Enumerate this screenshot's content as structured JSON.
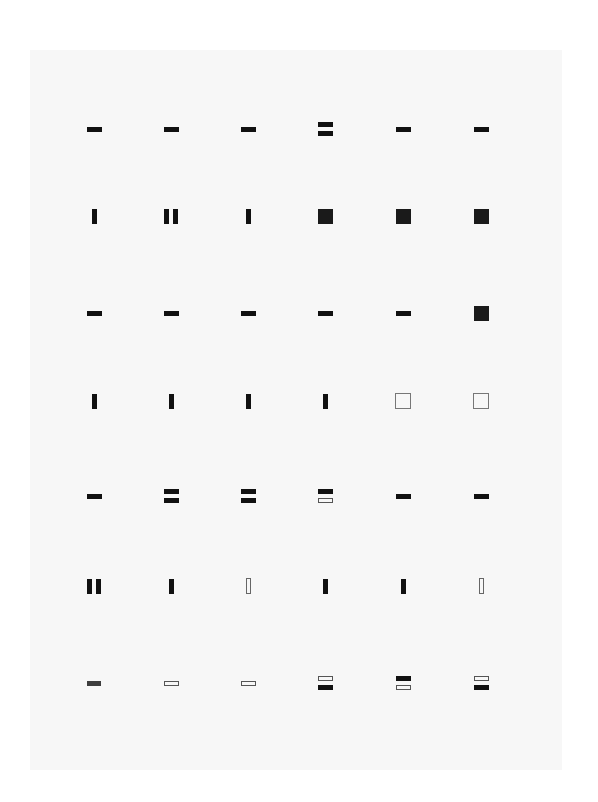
{
  "sheet": {
    "background": "#ffffff",
    "paper_color": "#f7f7f7",
    "ink_color": "#111111",
    "columns_x": [
      94,
      171,
      248,
      325,
      403,
      481
    ],
    "rows_y": [
      129,
      216,
      313,
      401,
      496,
      586,
      683
    ]
  },
  "grid": {
    "rows": [
      [
        "h-bar",
        "h-bar",
        "h-bar",
        "double-h-bar",
        "h-bar",
        "h-bar"
      ],
      [
        "v-bar",
        "double-v-bar",
        "v-bar",
        "square",
        "square",
        "square"
      ],
      [
        "h-bar",
        "h-bar",
        "h-bar",
        "h-bar",
        "h-bar",
        "square"
      ],
      [
        "v-bar",
        "v-bar",
        "v-bar",
        "v-bar",
        "square-outline",
        "square-outline"
      ],
      [
        "h-bar",
        "double-h-bar",
        "double-h-bar",
        "h-bar-over-outline",
        "h-bar",
        "h-bar"
      ],
      [
        "double-v-bar",
        "v-bar",
        "v-bar-outline",
        "v-bar",
        "v-bar",
        "v-bar-outline"
      ],
      [
        "h-bar-gray",
        "h-bar-outline",
        "h-bar-outline",
        "outline-over-h-bar",
        "h-bar-over-outline",
        "outline-over-h-bar"
      ]
    ]
  }
}
